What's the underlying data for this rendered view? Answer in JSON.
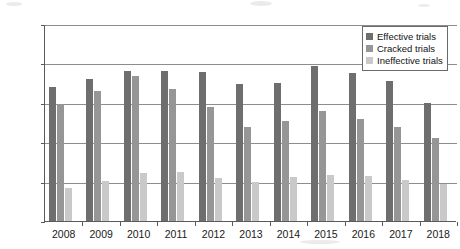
{
  "chart_data": {
    "type": "bar",
    "title": "",
    "subtitle": "",
    "xlabel": "",
    "ylabel": "",
    "ylim": [
      0,
      25000
    ],
    "ytick_step": 5000,
    "yticks": [
      0,
      5000,
      10000,
      15000,
      20000,
      25000
    ],
    "ytick_labels": [
      "0",
      "5000",
      "10000",
      "15000",
      "20000",
      "25000"
    ],
    "grid": true,
    "grid_axis": "y",
    "legend_position": "top-right",
    "categories": [
      "2008",
      "2009",
      "2010",
      "2011",
      "2012",
      "2013",
      "2014",
      "2015",
      "2016",
      "2017",
      "2018"
    ],
    "series": [
      {
        "name": "Effective trials",
        "color": "#6e6e6e",
        "values": [
          17000,
          18000,
          19100,
          19100,
          18900,
          17400,
          17500,
          19700,
          18800,
          17800,
          15000
        ]
      },
      {
        "name": "Cracked trials",
        "color": "#969696",
        "values": [
          14900,
          16500,
          18400,
          16700,
          14500,
          11900,
          12700,
          13900,
          12900,
          11900,
          10500
        ]
      },
      {
        "name": "Ineffective trials",
        "color": "#c9c9c9",
        "values": [
          4200,
          5100,
          6100,
          6200,
          5500,
          4900,
          5600,
          5900,
          5700,
          5200,
          4700
        ]
      }
    ]
  },
  "legend": {
    "items": [
      {
        "label": "Effective trials",
        "color": "#6e6e6e"
      },
      {
        "label": "Cracked trials",
        "color": "#969696"
      },
      {
        "label": "Ineffective trials",
        "color": "#c9c9c9"
      }
    ]
  }
}
